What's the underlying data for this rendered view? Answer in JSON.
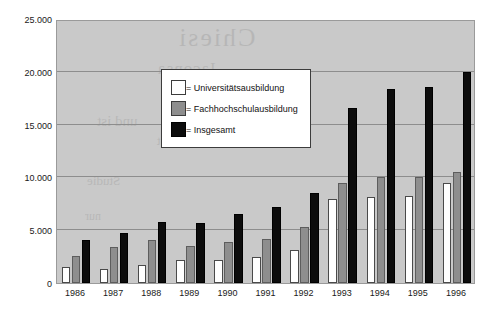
{
  "chart_data": {
    "type": "bar",
    "title": "",
    "subtitle": "",
    "xlabel": "",
    "ylabel": "",
    "categories": [
      "1986",
      "1987",
      "1988",
      "1989",
      "1990",
      "1991",
      "1992",
      "1993",
      "1994",
      "1995",
      "1996"
    ],
    "series": [
      {
        "name": "= Universitätsausbildung",
        "key": "uni",
        "color": "#ffffff",
        "values": [
          1500,
          1300,
          1700,
          2200,
          2200,
          2500,
          3100,
          8000,
          8100,
          8200,
          9500
        ]
      },
      {
        "name": "= Fachhochschulausbildung",
        "key": "fh",
        "color": "#8e8e8e",
        "values": [
          2600,
          3400,
          4100,
          3500,
          3900,
          4200,
          5300,
          9500,
          10000,
          10000,
          10500
        ]
      },
      {
        "name": "= Insgesamt",
        "key": "ins",
        "color": "#0c0c0c",
        "values": [
          4100,
          4700,
          5800,
          5700,
          6500,
          7200,
          8500,
          16600,
          18400,
          18600,
          20000
        ]
      }
    ],
    "ylim": [
      0,
      25000
    ],
    "ytick_values": [
      0,
      5000,
      10000,
      15000,
      20000,
      25000
    ],
    "ytick_labels": [
      "0",
      "5.000",
      "10.000",
      "15.000",
      "20.000",
      "25.000"
    ],
    "grid": true,
    "legend_position": "inside-top-left",
    "plot_background": "#c9c9c9",
    "figure_background": "#ffffff",
    "gridline_color": "#8d8d8d"
  },
  "legend": {
    "items": [
      {
        "label": "= Universitätsausbildung",
        "swatch": "uni"
      },
      {
        "label": "= Fachhochschulausbildung",
        "swatch": "fh"
      },
      {
        "label": "= Insgesamt",
        "swatch": "ins"
      }
    ]
  },
  "watermark": {
    "lines": [
      "Chiesi",
      "Jaconsa",
      "und ist",
      "kommt",
      "Studie",
      "nur"
    ]
  }
}
